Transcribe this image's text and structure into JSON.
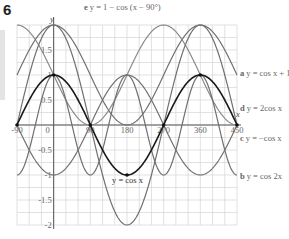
{
  "figure_number": "6",
  "chart_data": {
    "type": "line",
    "title": "",
    "xlabel": "x",
    "ylabel": "y",
    "xlim": [
      -90,
      450
    ],
    "ylim": [
      -2,
      2
    ],
    "grid": true,
    "x_ticks": [
      -90,
      0,
      90,
      180,
      270,
      360,
      450
    ],
    "x_tick_labels": [
      "-90",
      "0",
      "90",
      "180",
      "270",
      "360",
      "450"
    ],
    "y_ticks": [
      -2,
      -1.5,
      -1,
      -0.5,
      0.5,
      1,
      1.5
    ],
    "y_tick_labels": [
      "-2",
      "-1.5",
      "-1",
      "-0.5",
      "0.5",
      "1",
      "1.5"
    ],
    "series": [
      {
        "id": "base",
        "name": "y = cos x",
        "letter": "",
        "expr": "cos x",
        "color": "#1a1a1a",
        "width": 1.6
      },
      {
        "id": "a",
        "name": "y = cos x + 1",
        "letter": "a",
        "expr": "cos x + 1",
        "color": "#707070",
        "width": 1.2
      },
      {
        "id": "b",
        "name": "y = cos 2x",
        "letter": "b",
        "expr": "cos 2x",
        "color": "#707070",
        "width": 1.2
      },
      {
        "id": "c",
        "name": "y = −cos x",
        "letter": "c",
        "expr": "-cos x",
        "color": "#707070",
        "width": 1.2
      },
      {
        "id": "d",
        "name": "y = 2cos x",
        "letter": "d",
        "expr": "2cos x",
        "color": "#707070",
        "width": 1.2
      },
      {
        "id": "e",
        "name": "y = 1 − cos (x − 90°)",
        "letter": "e",
        "expr": "1 - cos(x - 90)",
        "color": "#8a8a8a",
        "width": 1.2
      }
    ],
    "annotations": [
      {
        "text": "y = cos x",
        "x": 180,
        "y": -1.4
      }
    ]
  },
  "labels": {
    "a": {
      "letter": "a",
      "text": "y = cos x + 1"
    },
    "b": {
      "letter": "b",
      "text": "y = cos 2x"
    },
    "c": {
      "letter": "c",
      "text": "y = −cos x"
    },
    "d": {
      "letter": "d",
      "text": "y = 2cos x"
    },
    "e": {
      "letter": "e",
      "text": "y = 1 − cos (x − 90°)"
    },
    "base": {
      "text": "y = cos x"
    },
    "x_axis": "x",
    "y_axis": "y"
  }
}
